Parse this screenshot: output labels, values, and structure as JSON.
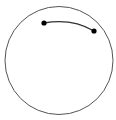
{
  "diagram": {
    "background": "#ffffff",
    "circle": {
      "cx": 59,
      "cy": 60.5,
      "r": 54,
      "stroke": "#555555",
      "stroke_width": 1
    },
    "arc": {
      "path": "M 44 23 Q 72 18 94 31",
      "stroke": "#333333",
      "stroke_width": 1.4
    },
    "points": [
      {
        "cx": 44,
        "cy": 23,
        "r": 2.6,
        "fill": "#000000"
      },
      {
        "cx": 94,
        "cy": 31,
        "r": 2.6,
        "fill": "#000000"
      }
    ]
  }
}
